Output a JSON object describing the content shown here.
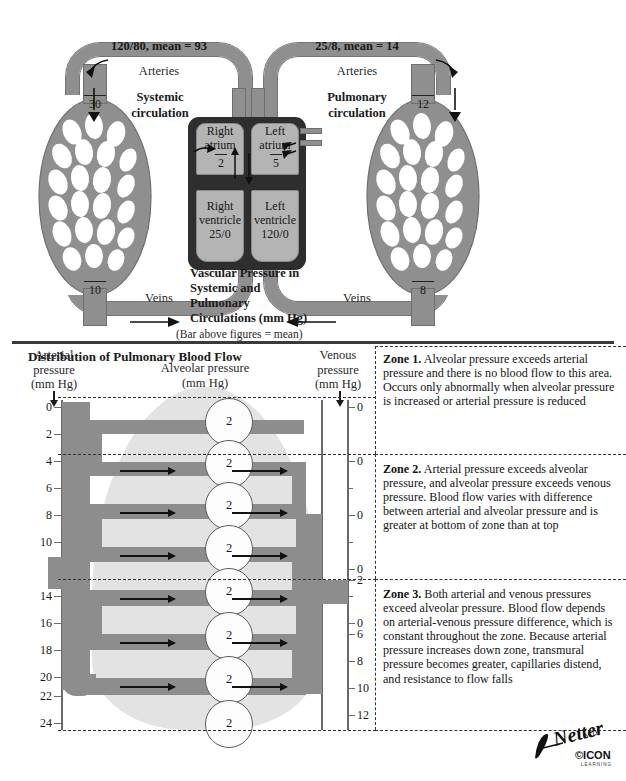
{
  "top_diagram": {
    "systemic": {
      "artery_pressure": "120/80, mean = 93",
      "arteries_label": "Arteries",
      "title": "Systemic\ncirculation",
      "title_line1": "Systemic",
      "title_line2": "circulation",
      "veins_label": "Veins",
      "bed_top_value": "30",
      "bed_bottom_value": "10"
    },
    "pulmonary": {
      "artery_pressure": "25/8, mean = 14",
      "arteries_label": "Arteries",
      "title_line1": "Pulmonary",
      "title_line2": "circulation",
      "veins_label": "Veins",
      "bed_top_value": "12",
      "bed_bottom_value": "8"
    },
    "heart": {
      "right_atrium_line1": "Right",
      "right_atrium_line2": "atrium",
      "right_atrium_value": "2",
      "left_atrium_line1": "Left",
      "left_atrium_line2": "atrium",
      "left_atrium_value": "5",
      "right_ventricle_line1": "Right",
      "right_ventricle_line2": "ventricle",
      "right_ventricle_value": "25/0",
      "left_ventricle_line1": "Left",
      "left_ventricle_line2": "ventricle",
      "left_ventricle_value": "120/0"
    },
    "caption": {
      "line1": "Vascular Pressure in",
      "line2": "Systemic and",
      "line3": "Pulmonary",
      "line4": "Circulations (mm Hg)",
      "note": "(Bar above figures = mean)"
    }
  },
  "lower_panel": {
    "title": "Distribution of Pulmonary Blood Flow",
    "arterial_header": {
      "l1": "Arterial",
      "l2": "pressure",
      "l3": "(mm Hg)"
    },
    "alveolar_header": {
      "l1": "Alveolar pressure",
      "l2": "(mm Hg)"
    },
    "venous_header": {
      "l1": "Venous",
      "l2": "pressure",
      "l3": "(mm Hg)"
    },
    "arterial_ticks": [
      "0",
      "2",
      "4",
      "6",
      "8",
      "10",
      "14",
      "16",
      "18",
      "20",
      "22",
      "24"
    ],
    "venous_ticks": [
      "0",
      "0",
      "0",
      "0",
      "0",
      "2",
      "6",
      "8",
      "10",
      "12"
    ],
    "alveolar_values": [
      "2",
      "2",
      "2",
      "2",
      "2",
      "2",
      "2",
      "2",
      "2"
    ],
    "zones": [
      {
        "name": "Zone 1.",
        "text": " Alveolar pressure exceeds arterial pressure and there is no blood flow to this area. Occurs only abnormally when alveolar pressure is increased or arterial pressure is reduced"
      },
      {
        "name": "Zone 2.",
        "text": " Arterial pressure exceeds alveolar pressure, and alveolar pressure exceeds venous pressure. Blood flow varies with difference between arterial and alveolar pressure and is greater at bottom of zone than at top"
      },
      {
        "name": "Zone 3.",
        "text": " Both arterial and venous pressures exceed alveolar pressure. Blood flow depends on arterial-venous pressure difference, which is constant throughout the zone. Because arterial pressure increases down zone, transmural pressure becomes greater, capillaries distend, and resistance to flow falls"
      }
    ]
  },
  "signature": {
    "name": "F. Netter",
    "mark": "ICON"
  },
  "colors": {
    "vessel_gray": "#8d8d8d",
    "vessel_dark": "#6f6f6f",
    "heart_dark": "#2e2e2e",
    "chamber_gray": "#b4b4b4",
    "lung_shade": "#e3e3e3",
    "ink": "#1a1a1a"
  }
}
